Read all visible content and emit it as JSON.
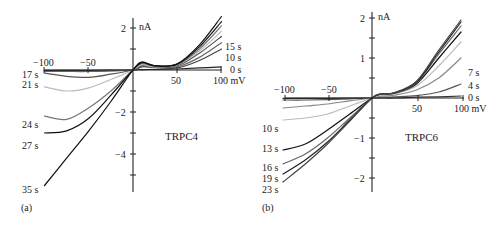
{
  "figure": {
    "panels": [
      {
        "id": "a",
        "letter": "(a)",
        "title": "TRPC4",
        "y_unit": "nA",
        "x_unit_label": "100 mV",
        "x_ticks": [
          "−100",
          "−50",
          "50"
        ],
        "y_ticks": [
          "2",
          "−2",
          "−4"
        ],
        "trace_labels_left": [
          "17 s",
          "21 s",
          "24 s",
          "27 s",
          "35 s"
        ],
        "trace_labels_right": [
          "15 s",
          "10 s",
          "0 s"
        ]
      },
      {
        "id": "b",
        "letter": "(b)",
        "title": "TRPC6",
        "y_unit": "nA",
        "x_unit_label": "100 mV",
        "x_ticks": [
          "−100",
          "−50",
          "50"
        ],
        "y_ticks": [
          "2",
          "1",
          "−1",
          "−2"
        ],
        "trace_labels_left": [
          "10 s",
          "13 s",
          "16 s",
          "19 s",
          "23 s"
        ],
        "trace_labels_right": [
          "7 s",
          "4 s",
          "0 s"
        ]
      }
    ]
  },
  "chart_data": [
    {
      "type": "line",
      "title": "TRPC4",
      "panel": "(a)",
      "xlabel": "mV",
      "ylabel": "nA",
      "xlim": [
        -100,
        100
      ],
      "ylim": [
        -5.8,
        2.2
      ],
      "x_ticks": [
        -100,
        -50,
        50,
        100
      ],
      "y_ticks": [
        2,
        -2,
        -4
      ],
      "grid": false,
      "x": [
        -100,
        -75,
        -50,
        -25,
        0,
        10,
        25,
        50,
        75,
        100
      ],
      "series": [
        {
          "name": "0 s",
          "color": "#222222",
          "values": [
            -0.02,
            -0.02,
            -0.02,
            -0.01,
            0,
            0.02,
            0.03,
            0.05,
            0.1,
            0.15
          ]
        },
        {
          "name": "10 s",
          "color": "#444444",
          "values": [
            -0.05,
            -0.05,
            -0.05,
            -0.03,
            0,
            0.15,
            0.12,
            0.1,
            0.45,
            1.0
          ]
        },
        {
          "name": "15 s",
          "color": "#666666",
          "values": [
            -0.07,
            -0.07,
            -0.07,
            -0.04,
            0,
            0.2,
            0.15,
            0.15,
            0.6,
            1.3
          ]
        },
        {
          "name": "17 s",
          "color": "#555555",
          "values": [
            -0.15,
            -0.3,
            -0.35,
            -0.2,
            0,
            0.2,
            0.15,
            0.2,
            0.8,
            1.6
          ]
        },
        {
          "name": "21 s",
          "color": "#bbbbbb",
          "values": [
            -0.8,
            -1.0,
            -0.85,
            -0.45,
            0,
            0.25,
            0.15,
            0.25,
            0.9,
            1.85
          ]
        },
        {
          "name": "24 s",
          "color": "#777777",
          "values": [
            -2.2,
            -2.35,
            -1.8,
            -1.0,
            0,
            0.3,
            0.18,
            0.25,
            1.0,
            2.1
          ]
        },
        {
          "name": "27 s",
          "color": "#111111",
          "values": [
            -3.0,
            -2.9,
            -2.3,
            -1.2,
            0,
            0.35,
            0.2,
            0.28,
            1.1,
            2.3
          ]
        },
        {
          "name": "35 s",
          "color": "#111111",
          "values": [
            -5.5,
            -4.2,
            -2.9,
            -1.5,
            0,
            0.38,
            0.2,
            0.3,
            1.2,
            2.55
          ]
        }
      ]
    },
    {
      "type": "line",
      "title": "TRPC6",
      "panel": "(b)",
      "xlabel": "mV",
      "ylabel": "nA",
      "xlim": [
        -100,
        100
      ],
      "ylim": [
        -2.35,
        2.1
      ],
      "x_ticks": [
        -100,
        -50,
        50,
        100
      ],
      "y_ticks": [
        2,
        1,
        -1,
        -2
      ],
      "grid": false,
      "x": [
        -100,
        -75,
        -50,
        -25,
        0,
        10,
        25,
        50,
        75,
        100
      ],
      "series": [
        {
          "name": "0 s",
          "color": "#333333",
          "values": [
            -0.01,
            -0.01,
            -0.01,
            -0.005,
            0,
            0.0,
            0.0,
            0.02,
            0.03,
            0.05
          ]
        },
        {
          "name": "4 s",
          "color": "#555555",
          "values": [
            -0.05,
            -0.05,
            -0.04,
            -0.02,
            0,
            0.02,
            0.03,
            0.06,
            0.15,
            0.35
          ]
        },
        {
          "name": "7 s",
          "color": "#888888",
          "values": [
            -0.25,
            -0.2,
            -0.15,
            -0.07,
            0,
            0.05,
            0.07,
            0.2,
            0.5,
            1.0
          ]
        },
        {
          "name": "10 s",
          "color": "#bbbbbb",
          "values": [
            -0.55,
            -0.5,
            -0.4,
            -0.2,
            0,
            0.08,
            0.1,
            0.3,
            0.8,
            1.4
          ]
        },
        {
          "name": "13 s",
          "color": "#111111",
          "values": [
            -1.3,
            -1.15,
            -0.8,
            -0.4,
            0,
            0.1,
            0.12,
            0.35,
            1.0,
            1.65
          ]
        },
        {
          "name": "16 s",
          "color": "#666666",
          "values": [
            -1.65,
            -1.4,
            -1.0,
            -0.5,
            0,
            0.1,
            0.12,
            0.38,
            1.1,
            1.8
          ]
        },
        {
          "name": "19 s",
          "color": "#222222",
          "values": [
            -1.9,
            -1.55,
            -1.1,
            -0.55,
            0,
            0.1,
            0.13,
            0.4,
            1.15,
            1.9
          ]
        },
        {
          "name": "23 s",
          "color": "#444444",
          "values": [
            -2.1,
            -1.65,
            -1.15,
            -0.58,
            0,
            0.1,
            0.13,
            0.42,
            1.2,
            1.95
          ]
        }
      ]
    }
  ]
}
